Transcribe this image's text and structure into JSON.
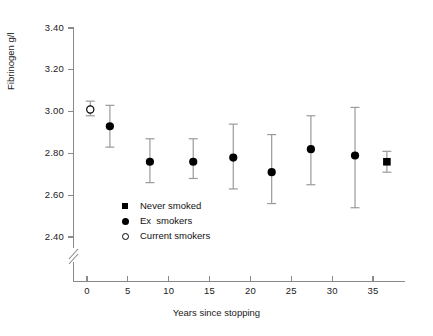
{
  "chart_data": {
    "type": "scatter",
    "title": "",
    "xlabel": "Years since stopping",
    "ylabel": "Fibrinogen g/l",
    "xlim": [
      0,
      37
    ],
    "ylim": [
      2.4,
      3.4
    ],
    "y_axis_break": true,
    "grid": false,
    "legend_position": "inside-lower-left",
    "xticks": [
      "0",
      "5",
      "10",
      "15",
      "20",
      "25",
      "30",
      "35"
    ],
    "xtick_values": [
      0,
      5,
      10,
      15,
      20,
      25,
      30,
      35
    ],
    "yticks": [
      "2.40",
      "2.60",
      "2.80",
      "3.00",
      "3.20",
      "3.40"
    ],
    "ytick_values": [
      2.4,
      2.6,
      2.8,
      3.0,
      3.2,
      3.4
    ],
    "series": [
      {
        "name": "Current smokers",
        "marker": "open-circle",
        "points": [
          {
            "x": 0.4,
            "y": 3.01,
            "low": 2.98,
            "high": 3.05
          }
        ]
      },
      {
        "name": "Ex smokers",
        "marker": "filled-circle",
        "points": [
          {
            "x": 2.8,
            "y": 2.93,
            "low": 2.83,
            "high": 3.03
          },
          {
            "x": 7.7,
            "y": 2.76,
            "low": 2.66,
            "high": 2.87
          },
          {
            "x": 13.0,
            "y": 2.76,
            "low": 2.68,
            "high": 2.87
          },
          {
            "x": 17.9,
            "y": 2.78,
            "low": 2.63,
            "high": 2.94
          },
          {
            "x": 22.6,
            "y": 2.71,
            "low": 2.56,
            "high": 2.89
          },
          {
            "x": 27.4,
            "y": 2.82,
            "low": 2.65,
            "high": 2.98
          },
          {
            "x": 32.8,
            "y": 2.79,
            "low": 2.54,
            "high": 3.02
          }
        ]
      },
      {
        "name": "Never smoked",
        "marker": "filled-square",
        "points": [
          {
            "x": 36.7,
            "y": 2.76,
            "low": 2.71,
            "high": 2.81
          }
        ]
      }
    ]
  },
  "axes": {
    "y_title": "Fibrinogen g/l",
    "x_title": "Years since stopping"
  },
  "legend": {
    "items": [
      {
        "label": "Never smoked",
        "marker": "filled-square"
      },
      {
        "label": "Ex  smokers",
        "marker": "filled-circle"
      },
      {
        "label": "Current smokers",
        "marker": "open-circle"
      }
    ]
  },
  "colors": {
    "ink": "#000000",
    "axis": "#8a8a8a",
    "background": "#ffffff"
  }
}
